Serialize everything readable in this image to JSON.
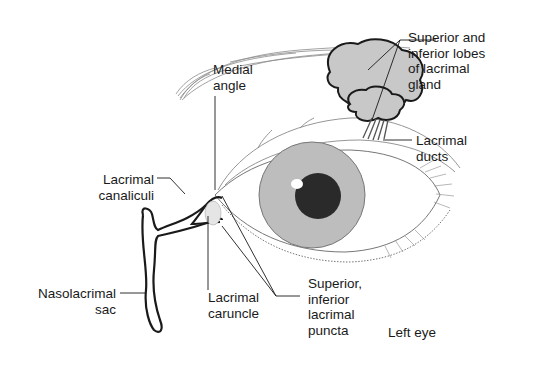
{
  "figure": {
    "caption": "Left eye"
  },
  "labels": {
    "lacrimal_gland": "Superior and\ninferior lobes\nof lacrimal\ngland",
    "lacrimal_ducts": "Lacrimal\nducts",
    "medial_angle": "Medial\nangle",
    "lacrimal_canaliculi": "Lacrimal\ncanaliculi",
    "nasolacrimal_sac": "Nasolacrimal\nsac",
    "lacrimal_caruncle": "Lacrimal\ncaruncle",
    "lacrimal_puncta": "Superior,\ninferior\nlacrimal\npuncta",
    "left_eye": "Left eye"
  },
  "colors": {
    "line": "#1a1a1a",
    "gland_fill": "#c8c8c8",
    "iris_fill": "#bdbdbd",
    "pupil_fill": "#2a2a2a",
    "sketch": "#9a9a9a"
  }
}
